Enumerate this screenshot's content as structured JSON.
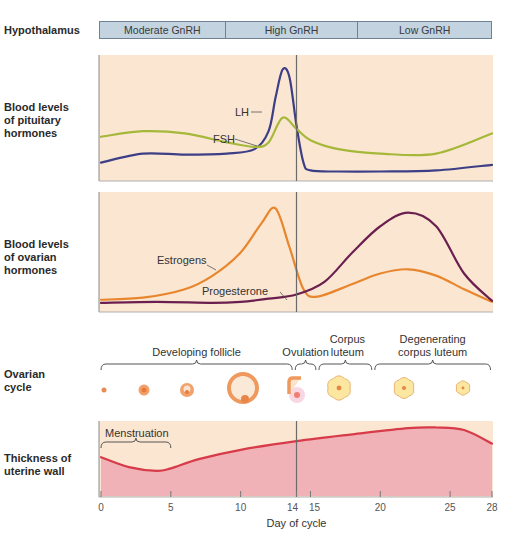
{
  "rows": {
    "hypothalamus": "Hypothalamus",
    "pituitary": "Blood levels\nof pituitary\nhormones",
    "ovarian_hormones": "Blood levels\nof ovarian\nhormones",
    "ovarian_cycle": "Ovarian\ncycle",
    "uterine": "Thickness of\nuterine wall"
  },
  "gnrh": [
    {
      "label": "Moderate GnRH",
      "from_day": 0,
      "to_day": 9
    },
    {
      "label": "High GnRH",
      "from_day": 9,
      "to_day": 18.5
    },
    {
      "label": "Low GnRH",
      "from_day": 18.5,
      "to_day": 28
    }
  ],
  "ovarian_stages": [
    {
      "label": "Developing follicle",
      "from_day": 0,
      "to_day": 13.8
    },
    {
      "label": "Ovulation",
      "from_day": 13.8,
      "to_day": 15.5
    },
    {
      "label": "Corpus\nluteum",
      "from_day": 15.5,
      "to_day": 19.5
    },
    {
      "label": "Degenerating\ncorpus luteum",
      "from_day": 19.5,
      "to_day": 28
    }
  ],
  "annotations": {
    "lh": "LH",
    "fsh": "FSH",
    "estrogens": "Estrogens",
    "progesterone": "Progesterone",
    "menstruation": "Menstruation"
  },
  "colors": {
    "panel_bg": "#fbe6d2",
    "gnrh_bg": "#c3d3e0",
    "lh": "#3c3f86",
    "fsh": "#a5b83a",
    "estrogens": "#e8862e",
    "progesterone": "#6a1f4e",
    "uterine_line": "#d73a48",
    "uterine_fill": "#f0b2b6",
    "ovulation_marker": "#6b6b6b"
  },
  "chart_data": {
    "type": "line",
    "title": "",
    "xlabel": "Day of cycle",
    "ylabel": "",
    "x_ticks": [
      0,
      5,
      10,
      14,
      15,
      20,
      25,
      28
    ],
    "xlim": [
      0,
      28
    ],
    "ovulation_day": 14,
    "panels": [
      {
        "name": "Blood levels of pituitary hormones",
        "series": [
          {
            "name": "LH",
            "x": [
              0,
              3,
              6,
              9,
              11,
              12,
              12.5,
              13,
              13.5,
              14,
              14.5,
              15,
              17,
              20,
              24,
              28
            ],
            "values": [
              0.12,
              0.2,
              0.19,
              0.2,
              0.24,
              0.4,
              0.7,
              0.95,
              0.88,
              0.45,
              0.12,
              0.05,
              0.04,
              0.04,
              0.05,
              0.1
            ]
          },
          {
            "name": "FSH",
            "x": [
              0,
              3,
              6,
              9,
              11,
              12,
              13,
              14,
              15,
              17,
              20,
              24,
              28
            ],
            "values": [
              0.35,
              0.4,
              0.38,
              0.3,
              0.26,
              0.3,
              0.52,
              0.42,
              0.32,
              0.24,
              0.2,
              0.2,
              0.38
            ]
          }
        ]
      },
      {
        "name": "Blood levels of ovarian hormones",
        "series": [
          {
            "name": "Estrogens",
            "x": [
              0,
              3,
              6,
              8,
              10,
              11.5,
              12.5,
              13.5,
              14.5,
              15.5,
              18,
              20,
              22,
              24,
              26,
              28
            ],
            "values": [
              0.05,
              0.07,
              0.15,
              0.28,
              0.5,
              0.78,
              0.92,
              0.55,
              0.15,
              0.08,
              0.2,
              0.3,
              0.34,
              0.28,
              0.15,
              0.03
            ]
          },
          {
            "name": "Progesterone",
            "x": [
              0,
              4,
              8,
              10,
              12,
              14,
              16,
              18,
              20,
              22,
              24,
              26,
              28
            ],
            "values": [
              0.02,
              0.03,
              0.02,
              0.03,
              0.06,
              0.1,
              0.22,
              0.5,
              0.75,
              0.88,
              0.75,
              0.3,
              0.04
            ]
          }
        ]
      },
      {
        "name": "Thickness of uterine wall",
        "series": [
          {
            "name": "Thickness",
            "x": [
              0,
              2,
              4,
              5,
              7,
              10,
              14,
              18,
              22,
              24,
              26,
              28
            ],
            "values": [
              0.48,
              0.32,
              0.26,
              0.3,
              0.45,
              0.6,
              0.74,
              0.85,
              0.95,
              0.96,
              0.92,
              0.7
            ]
          }
        ]
      }
    ]
  }
}
